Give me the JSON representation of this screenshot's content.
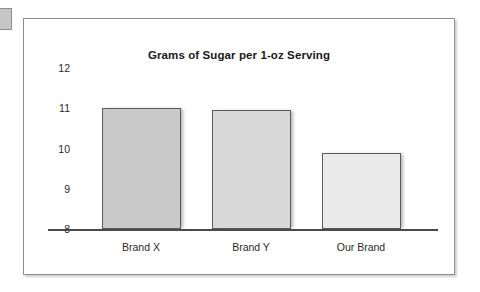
{
  "page": {
    "background_color": "#ffffff",
    "corner_tab_color": "#c6c6c6"
  },
  "chart_frame": {
    "border_color": "#8d8d8d",
    "background_color": "#ffffff"
  },
  "chart_data": {
    "type": "bar",
    "title": "Grams of Sugar per 1-oz Serving",
    "xlabel": "",
    "ylabel": "",
    "categories": [
      "Brand X",
      "Brand Y",
      "Our Brand"
    ],
    "values": [
      11,
      10.95,
      9.9
    ],
    "yticks": [
      12,
      11,
      10,
      9,
      8
    ],
    "ylim": [
      8,
      12
    ],
    "grid": false,
    "legend": false,
    "bar_colors": [
      "#c9c9c9",
      "#d8d8d8",
      "#eaeaea"
    ],
    "bar_border_color": "#5a5a5a",
    "axis_color": "#4a4a4a",
    "tick_label_color": "#2a2a2a",
    "title_color": "#1a1a1a"
  }
}
